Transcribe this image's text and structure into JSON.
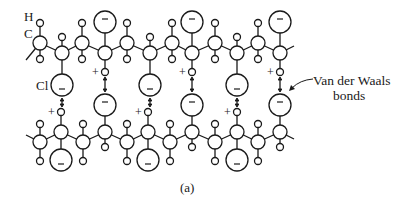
{
  "figure": {
    "caption": "(a)",
    "labels": {
      "hydrogen": "H",
      "carbon": "C",
      "chlorine": "Cl",
      "vdw_line1": "Van der Waals",
      "vdw_line2": "bonds"
    },
    "symbols": {
      "positive": "+",
      "negative": "−"
    },
    "colors": {
      "stroke": "#1a1a1a",
      "background": "#ffffff"
    },
    "top_chain": {
      "backbone_y_up": 43,
      "backbone_y_down": 53,
      "up_carbons_x": [
        40,
        82,
        127,
        172,
        215,
        258
      ],
      "down_carbons": [
        {
          "x": 62,
          "cl": "below"
        },
        {
          "x": 105,
          "cl": "above"
        },
        {
          "x": 150,
          "cl": "below"
        },
        {
          "x": 192,
          "cl": "above"
        },
        {
          "x": 237,
          "cl": "below"
        },
        {
          "x": 280,
          "cl": "above"
        }
      ]
    },
    "bottom_chain": {
      "backbone_y_up": 132,
      "backbone_y_down": 142,
      "down_carbons_x": [
        40,
        83,
        127,
        170,
        215,
        258
      ],
      "up_carbons": [
        {
          "x": 61,
          "cl": "below"
        },
        {
          "x": 105,
          "cl": "above"
        },
        {
          "x": 148,
          "cl": "below"
        },
        {
          "x": 192,
          "cl": "above"
        },
        {
          "x": 237,
          "cl": "below"
        },
        {
          "x": 280,
          "cl": "above"
        }
      ]
    },
    "vdw_bond_pairs_x": [
      62,
      105,
      150,
      192,
      237,
      280
    ]
  }
}
